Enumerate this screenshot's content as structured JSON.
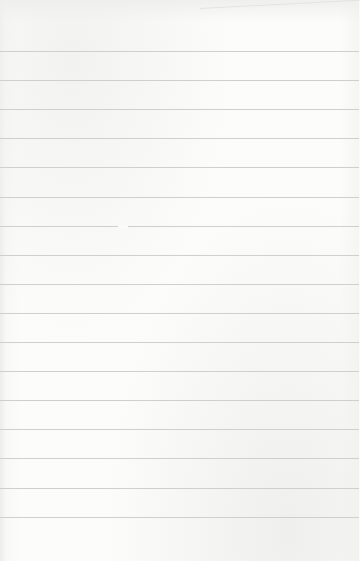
{
  "paper": {
    "kind": "lined notebook paper",
    "line_count": 17,
    "first_line_y": 51,
    "line_spacing": 29.1,
    "line_color": "#cfcfcd",
    "background_color": "#fbfbfa"
  }
}
